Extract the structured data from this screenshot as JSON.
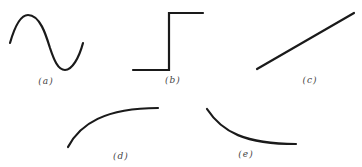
{
  "figure": {
    "panels": [
      {
        "id": "a",
        "label": "(a)",
        "shape": "sine wave (one full period)"
      },
      {
        "id": "b",
        "label": "(b)",
        "shape": "step function"
      },
      {
        "id": "c",
        "label": "(c)",
        "shape": "straight line, positive slope"
      },
      {
        "id": "d",
        "label": "(d)",
        "shape": "concave-down increasing curve (saturating)"
      },
      {
        "id": "e",
        "label": "(e)",
        "shape": "concave-up decreasing curve (decaying)"
      }
    ],
    "colors": {
      "stroke": "#1a1a1a",
      "label": "#444444",
      "background": "#ffffff"
    }
  }
}
